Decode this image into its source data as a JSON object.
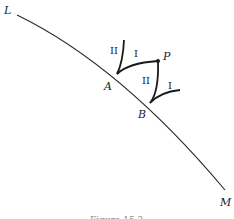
{
  "diagram": {
    "points": {
      "L": "L",
      "M": "M",
      "A": "A",
      "B": "B",
      "P": "P"
    },
    "curve_labels": {
      "A_I": "I",
      "A_II": "II",
      "B_I": "I",
      "B_II": "II"
    },
    "caption": "Figure 15.3",
    "colors": {
      "line": "#2a2a2a",
      "text": "#1a1a1a"
    }
  }
}
